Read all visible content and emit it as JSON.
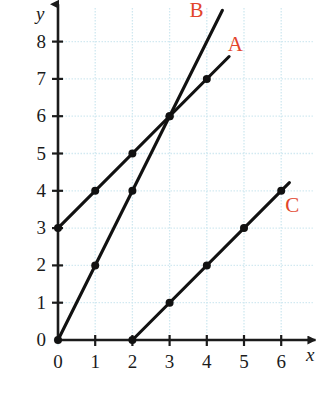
{
  "chart_data": {
    "type": "line",
    "title": "",
    "xlabel": "x",
    "ylabel": "y",
    "xlim": [
      0,
      6
    ],
    "ylim": [
      0,
      8
    ],
    "grid": true,
    "grid_color": "#cfe8f0",
    "axis_color": "#1b1b1b",
    "line_color": "#111111",
    "point_color": "#111111",
    "label_color": "#e2452c",
    "background": "#ffffff",
    "legend_position": "inline-end-of-line",
    "xticks": [
      "0",
      "1",
      "2",
      "3",
      "4",
      "5",
      "6"
    ],
    "yticks": [
      "0",
      "1",
      "2",
      "3",
      "4",
      "5",
      "6",
      "7",
      "8"
    ],
    "xtick_values": [
      0,
      1,
      2,
      3,
      4,
      5,
      6
    ],
    "ytick_values": [
      0,
      1,
      2,
      3,
      4,
      5,
      6,
      7,
      8
    ],
    "series": [
      {
        "name": "A",
        "equation": "y = x + 3",
        "slope": 1,
        "intercept": 3,
        "points": [
          [
            0,
            3
          ],
          [
            1,
            4
          ],
          [
            2,
            5
          ],
          [
            3,
            6
          ],
          [
            4,
            7
          ]
        ],
        "draw_from": [
          0,
          3
        ],
        "draw_to": [
          4.6,
          7.6
        ],
        "label": "A",
        "label_x": 4.75,
        "label_y": 8.05
      },
      {
        "name": "B",
        "equation": "y = 2x",
        "slope": 2,
        "intercept": 0,
        "points": [
          [
            0,
            0
          ],
          [
            1,
            2
          ],
          [
            2,
            4
          ],
          [
            3,
            6
          ]
        ],
        "draw_from": [
          0,
          0
        ],
        "draw_to": [
          4.42,
          8.84
        ],
        "label": "B",
        "label_x": 3.72,
        "label_y": 8.95
      },
      {
        "name": "C",
        "equation": "y = x - 2",
        "slope": 1,
        "intercept": -2,
        "points": [
          [
            2,
            0
          ],
          [
            3,
            1
          ],
          [
            4,
            2
          ],
          [
            5,
            3
          ],
          [
            6,
            4
          ]
        ],
        "draw_from": [
          2,
          0
        ],
        "draw_to": [
          6.22,
          4.22
        ],
        "label": "C",
        "label_x": 6.3,
        "label_y": 3.72
      }
    ],
    "intersections": [
      {
        "series": [
          "A",
          "B"
        ],
        "point": [
          3,
          6
        ]
      }
    ]
  },
  "axes": {
    "x_axis_name": "x",
    "y_axis_name": "y",
    "x_arrow": "arrow-right",
    "y_arrow": "arrow-up"
  }
}
